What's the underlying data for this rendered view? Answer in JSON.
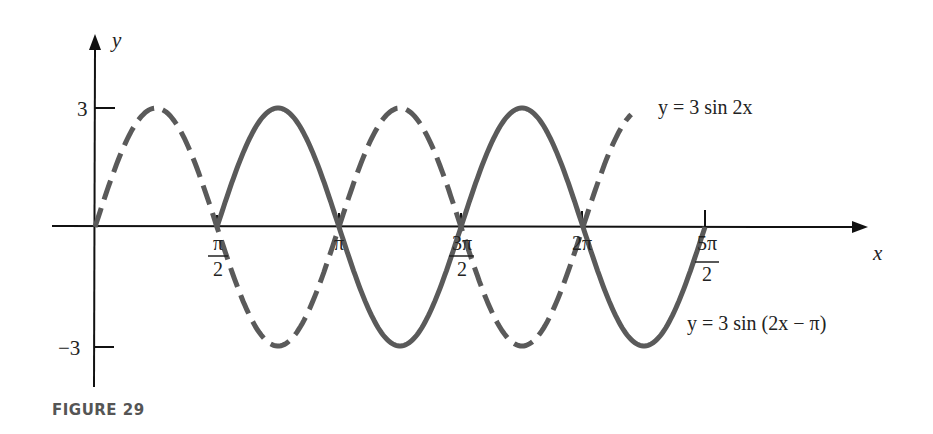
{
  "figure": {
    "caption": "FIGURE 29",
    "x_axis_label": "x",
    "y_axis_label": "y",
    "y_ticks": [
      {
        "label": "3",
        "value": 3
      },
      {
        "label": "−3",
        "value": -3
      }
    ],
    "x_ticks": [
      {
        "num": "π",
        "den": "2",
        "value": "π/2"
      },
      {
        "num": "π",
        "den": "",
        "value": "π"
      },
      {
        "num": "3π",
        "den": "2",
        "value": "3π/2"
      },
      {
        "num": "2π",
        "den": "",
        "value": "2π"
      },
      {
        "num": "5π",
        "den": "2",
        "value": "5π/2"
      }
    ],
    "curves": [
      {
        "name": "dashed",
        "label": "y = 3 sin 2x",
        "style": "dashed"
      },
      {
        "name": "solid",
        "label": "y = 3 sin (2x − π)",
        "style": "solid"
      }
    ],
    "colors": {
      "axis": "#111111",
      "curve": "#5a5a5a",
      "text": "#222222",
      "caption": "#555555"
    }
  },
  "chart_data": {
    "type": "line",
    "title": "FIGURE 29",
    "xlabel": "x",
    "ylabel": "y",
    "xlim": [
      0,
      7.854
    ],
    "ylim": [
      -3,
      3
    ],
    "x_tick_labels": [
      "π/2",
      "π",
      "3π/2",
      "2π",
      "5π/2"
    ],
    "y_tick_labels": [
      "3",
      "−3"
    ],
    "grid": false,
    "series": [
      {
        "name": "y = 3 sin 2x",
        "style": "dashed",
        "x": [
          0,
          0.785,
          1.571,
          2.356,
          3.142,
          3.927,
          4.712,
          5.498,
          6.283,
          6.9
        ],
        "y": [
          0,
          3,
          0,
          -3,
          0,
          3,
          0,
          -3,
          0,
          2.9
        ]
      },
      {
        "name": "y = 3 sin (2x − π)",
        "style": "solid",
        "x": [
          1.571,
          2.356,
          3.142,
          3.927,
          4.712,
          5.498,
          6.283,
          7.069,
          7.854
        ],
        "y": [
          0,
          3,
          0,
          -3,
          0,
          3,
          0,
          -3,
          0
        ]
      }
    ]
  }
}
